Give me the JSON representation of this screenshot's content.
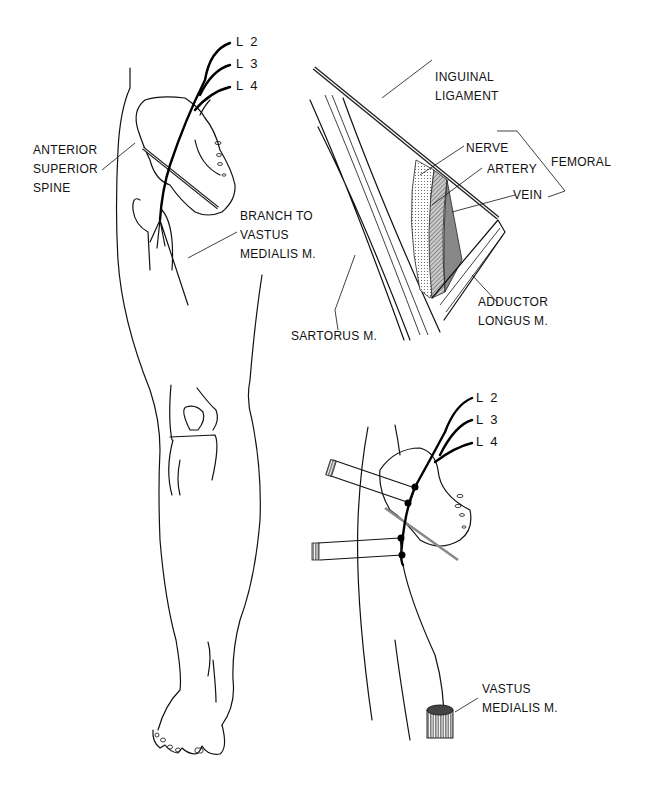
{
  "figure": {
    "panels": [
      {
        "id": "full-leg",
        "labels": {
          "roots": [
            "L 2",
            "L 3",
            "L 4"
          ],
          "asis": [
            "ANTERIOR",
            "SUPERIOR",
            "SPINE"
          ],
          "branch": [
            "BRANCH TO",
            "VASTUS",
            "MEDIALIS M."
          ]
        }
      },
      {
        "id": "femoral-triangle",
        "labels": {
          "inguinal": [
            "INGUINAL",
            "LIGAMENT"
          ],
          "nerve": "NERVE",
          "artery": "ARTERY",
          "vein": "VEIN",
          "femoral": "FEMORAL",
          "sartorus": "SARTORUS M.",
          "adductor": [
            "ADDUCTOR",
            "LONGUS M."
          ]
        }
      },
      {
        "id": "nerve-stimulation",
        "labels": {
          "roots": [
            "L 2",
            "L 3",
            "L 4"
          ],
          "vastus": [
            "VASTUS",
            "MEDIALIS M."
          ]
        }
      }
    ]
  }
}
